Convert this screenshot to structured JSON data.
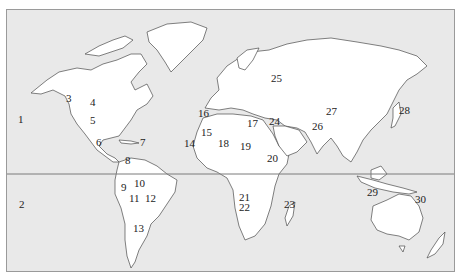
{
  "map": {
    "type": "world-outline",
    "ocean_color": "#e9e9e9",
    "land_color": "#ffffff",
    "outline_color": "#4a4a4a",
    "equator_line": true,
    "labels": [
      {
        "id": "1",
        "text": "1",
        "x": 17,
        "y": 119
      },
      {
        "id": "2",
        "text": "2",
        "x": 18,
        "y": 204
      },
      {
        "id": "3",
        "text": "3",
        "x": 65,
        "y": 98
      },
      {
        "id": "4",
        "text": "4",
        "x": 89,
        "y": 102
      },
      {
        "id": "5",
        "text": "5",
        "x": 89,
        "y": 120
      },
      {
        "id": "6",
        "text": "6",
        "x": 95,
        "y": 142
      },
      {
        "id": "7",
        "text": "7",
        "x": 139,
        "y": 142
      },
      {
        "id": "8",
        "text": "8",
        "x": 124,
        "y": 160
      },
      {
        "id": "9",
        "text": "9",
        "x": 120,
        "y": 187
      },
      {
        "id": "10",
        "text": "10",
        "x": 133,
        "y": 183
      },
      {
        "id": "11",
        "text": "11",
        "x": 128,
        "y": 198
      },
      {
        "id": "12",
        "text": "12",
        "x": 144,
        "y": 198
      },
      {
        "id": "13",
        "text": "13",
        "x": 132,
        "y": 228
      },
      {
        "id": "14",
        "text": "14",
        "x": 183,
        "y": 143
      },
      {
        "id": "15",
        "text": "15",
        "x": 200,
        "y": 132
      },
      {
        "id": "16",
        "text": "16",
        "x": 197,
        "y": 113
      },
      {
        "id": "17",
        "text": "17",
        "x": 246,
        "y": 123
      },
      {
        "id": "18",
        "text": "18",
        "x": 217,
        "y": 143
      },
      {
        "id": "19",
        "text": "19",
        "x": 239,
        "y": 146
      },
      {
        "id": "20",
        "text": "20",
        "x": 266,
        "y": 158
      },
      {
        "id": "21",
        "text": "21",
        "x": 238,
        "y": 197
      },
      {
        "id": "22",
        "text": "22",
        "x": 238,
        "y": 207
      },
      {
        "id": "23",
        "text": "23",
        "x": 283,
        "y": 204
      },
      {
        "id": "24",
        "text": "24",
        "x": 268,
        "y": 121
      },
      {
        "id": "25",
        "text": "25",
        "x": 270,
        "y": 78
      },
      {
        "id": "26",
        "text": "26",
        "x": 311,
        "y": 126
      },
      {
        "id": "27",
        "text": "27",
        "x": 325,
        "y": 111
      },
      {
        "id": "28",
        "text": "28",
        "x": 398,
        "y": 110
      },
      {
        "id": "29",
        "text": "29",
        "x": 366,
        "y": 192
      },
      {
        "id": "30",
        "text": "30",
        "x": 414,
        "y": 199
      }
    ]
  }
}
